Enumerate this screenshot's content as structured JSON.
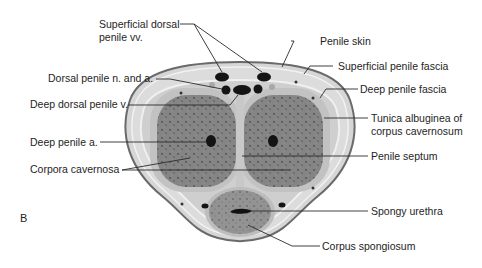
{
  "figure": {
    "panel_letter": "B",
    "colors": {
      "skin": "#6e6e6e",
      "fascia_fill": "#d3d3d3",
      "fascia_light": "#ececec",
      "tunica": "#c4c4c4",
      "cavernosa": "#7f7f7f",
      "spongiosum": "#8c8c8c",
      "vessel": "#141414",
      "leader": "#2a2a2a"
    }
  },
  "labels": {
    "superficial_dorsal_vv": "Superficial dorsal\npenile vv.",
    "dorsal_n_a": "Dorsal penile n. and a.",
    "deep_dorsal_v": "Deep dorsal penile v.",
    "deep_penile_a": "Deep penile a.",
    "corpora_cavernosa": "Corpora cavernosa",
    "penile_skin": "Penile skin",
    "superficial_fascia": "Superficial penile fascia",
    "deep_fascia": "Deep penile fascia",
    "tunica_albuginea": "Tunica albuginea of\ncorpus cavernosum",
    "penile_septum": "Penile septum",
    "spongy_urethra": "Spongy urethra",
    "corpus_spongiosum": "Corpus spongiosum"
  }
}
